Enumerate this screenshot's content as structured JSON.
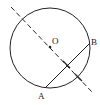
{
  "diagram": {
    "type": "geometry",
    "labels": {
      "center": "O",
      "point_a": "A",
      "point_b": "B"
    },
    "colors": {
      "stroke": "#222222",
      "background": "#ffffff"
    }
  }
}
